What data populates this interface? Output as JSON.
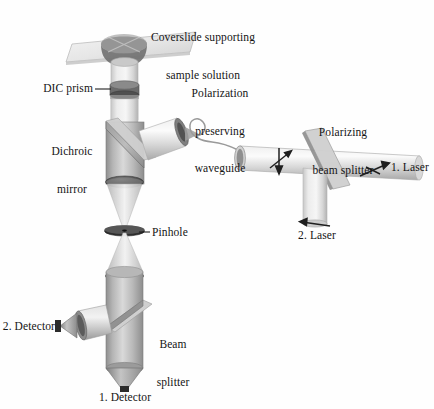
{
  "figure": {
    "type": "optical-setup-diagram",
    "style": "grayscale shaded 3D line drawing",
    "background_color": "#ffffff",
    "palette": {
      "tube_light": "#dcdcdc",
      "tube_mid": "#a9a9a9",
      "tube_dark": "#8a8a8a",
      "lens_dark": "#4a4a4a",
      "outline": "#6e6e6e",
      "text": "#141414"
    }
  },
  "labels": {
    "coverslide": {
      "line1": "Coverslide supporting",
      "line2": "sample solution"
    },
    "dic_prism": {
      "text": "DIC prism"
    },
    "dichroic_mirror": {
      "line1": "Dichroic",
      "line2": "mirror"
    },
    "waveguide": {
      "line1": "Polarization",
      "line2": "preserving",
      "line3": "waveguide"
    },
    "polarizing_beam_splitter": {
      "line1": "Polarizing",
      "line2": "beam splitter"
    },
    "laser1": {
      "text": "1. Laser"
    },
    "laser2": {
      "text": "2. Laser"
    },
    "pinhole": {
      "text": "Pinhole"
    },
    "beam_splitter": {
      "line1": "Beam",
      "line2": "splitter"
    },
    "detector2": {
      "text": "2. Detector"
    },
    "detector1": {
      "text": "1. Detector"
    }
  },
  "components": [
    {
      "name": "coverslide-plate",
      "label": "Coverslide supporting sample solution",
      "kind": "flat-glass-plate"
    },
    {
      "name": "objective-lens",
      "label": "",
      "kind": "objective-cone"
    },
    {
      "name": "dic-prism-band",
      "label": "DIC prism",
      "kind": "prism-band"
    },
    {
      "name": "dichroic-mirror-plate",
      "label": "Dichroic mirror",
      "kind": "tilted-mirror"
    },
    {
      "name": "collimating-lens",
      "label": "",
      "kind": "lens"
    },
    {
      "name": "pinhole-disk",
      "label": "Pinhole",
      "kind": "aperture-disk"
    },
    {
      "name": "relay-lens",
      "label": "",
      "kind": "lens"
    },
    {
      "name": "beam-splitter-plate",
      "label": "Beam splitter",
      "kind": "tilted-splitter"
    },
    {
      "name": "detector-1",
      "label": "1. Detector",
      "kind": "detector-cone"
    },
    {
      "name": "detector-2",
      "label": "2. Detector",
      "kind": "detector-cone"
    },
    {
      "name": "waveguide-fiber",
      "label": "Polarization preserving waveguide",
      "kind": "coiled-fiber"
    },
    {
      "name": "polarizing-beam-splitter-plate",
      "label": "Polarizing beam splitter",
      "kind": "tilted-splitter"
    },
    {
      "name": "laser-1-tube",
      "label": "1. Laser",
      "kind": "laser-tube"
    },
    {
      "name": "laser-2-tube",
      "label": "2. Laser",
      "kind": "laser-tube"
    },
    {
      "name": "polarization-arrows",
      "label": "",
      "kind": "polarization-symbol"
    }
  ]
}
